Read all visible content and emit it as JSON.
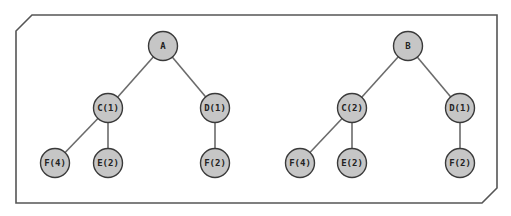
{
  "diagram": {
    "type": "tree-comparison",
    "colors": {
      "frame": "#555555",
      "edge": "#6b6b6b",
      "node_fill": "#c6c6c6",
      "node_stroke": "#3a3a3a",
      "text": "#222222"
    },
    "trees": [
      {
        "root": "A",
        "nodes": [
          {
            "id": "a_root",
            "label": "A",
            "x": 163,
            "y": 46
          },
          {
            "id": "a_c",
            "label": "C(1)",
            "x": 108,
            "y": 108
          },
          {
            "id": "a_d",
            "label": "D(1)",
            "x": 215,
            "y": 108
          },
          {
            "id": "a_f4",
            "label": "F(4)",
            "x": 55,
            "y": 163
          },
          {
            "id": "a_e2",
            "label": "E(2)",
            "x": 108,
            "y": 163
          },
          {
            "id": "a_f2",
            "label": "F(2)",
            "x": 215,
            "y": 163
          }
        ],
        "edges": [
          [
            "a_root",
            "a_c"
          ],
          [
            "a_root",
            "a_d"
          ],
          [
            "a_c",
            "a_f4"
          ],
          [
            "a_c",
            "a_e2"
          ],
          [
            "a_d",
            "a_f2"
          ]
        ]
      },
      {
        "root": "B",
        "nodes": [
          {
            "id": "b_root",
            "label": "B",
            "x": 408,
            "y": 46
          },
          {
            "id": "b_c",
            "label": "C(2)",
            "x": 352,
            "y": 108
          },
          {
            "id": "b_d",
            "label": "D(1)",
            "x": 460,
            "y": 108
          },
          {
            "id": "b_f4",
            "label": "F(4)",
            "x": 300,
            "y": 163
          },
          {
            "id": "b_e2",
            "label": "E(2)",
            "x": 352,
            "y": 163
          },
          {
            "id": "b_f2",
            "label": "F(2)",
            "x": 460,
            "y": 163
          }
        ],
        "edges": [
          [
            "b_root",
            "b_c"
          ],
          [
            "b_root",
            "b_d"
          ],
          [
            "b_c",
            "b_f4"
          ],
          [
            "b_c",
            "b_e2"
          ],
          [
            "b_d",
            "b_f2"
          ]
        ]
      }
    ]
  }
}
